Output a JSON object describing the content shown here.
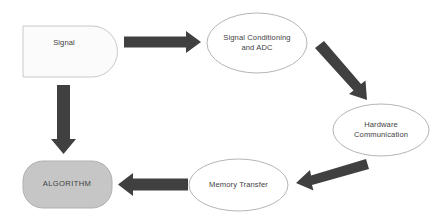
{
  "diagram": {
    "background_color": "#ffffff",
    "arrow_color": "#404040",
    "outline_color": "#b0b0b0",
    "text_color": "#3f3f3f",
    "nodes": [
      {
        "id": "signal",
        "label": "Signal",
        "shape": "rounded-right-rectangle",
        "fill": "#fbfbfb",
        "stroke": "#c8c8c8"
      },
      {
        "id": "conditioning",
        "label": "Signal Conditioning\nand ADC",
        "shape": "ellipse",
        "fill": "#ffffff",
        "stroke": "#b5b5b5"
      },
      {
        "id": "hardware",
        "label": "Hardware\nCommunication",
        "shape": "ellipse",
        "fill": "#ffffff",
        "stroke": "#b5b5b5"
      },
      {
        "id": "memory",
        "label": "Memory Transfer",
        "shape": "ellipse",
        "fill": "#ffffff",
        "stroke": "#b5b5b5"
      },
      {
        "id": "algorithm",
        "label": "ALGORITHM",
        "shape": "rounded-rectangle",
        "fill": "#c6c6c6",
        "stroke": "#b0b0b0"
      }
    ],
    "connectors": [
      {
        "id": "signal-to-conditioning",
        "from": "signal",
        "to": "conditioning",
        "direction": "right",
        "style": "block-arrow"
      },
      {
        "id": "conditioning-to-hardware",
        "from": "conditioning",
        "to": "hardware",
        "direction": "down-right",
        "style": "block-arrow"
      },
      {
        "id": "hardware-to-memory",
        "from": "hardware",
        "to": "memory",
        "direction": "down-left",
        "style": "block-arrow"
      },
      {
        "id": "memory-to-algorithm",
        "from": "memory",
        "to": "algorithm",
        "direction": "left",
        "style": "block-arrow"
      },
      {
        "id": "signal-to-algorithm",
        "from": "signal",
        "to": "algorithm",
        "direction": "down",
        "style": "block-arrow"
      }
    ]
  }
}
